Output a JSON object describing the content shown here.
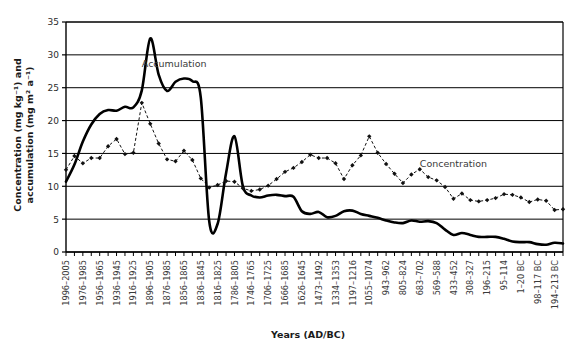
{
  "chart_data": {
    "type": "line",
    "title": "",
    "xlabel": "Years (AD/BC)",
    "ylabel": "Concentration (mg kg⁻¹) and accumulation (mg m² a⁻¹)",
    "ylabel_line1": "Concentration (mg kg⁻¹) and",
    "ylabel_line2": "accumulation (mg m² a⁻¹)",
    "ylim": [
      0,
      35
    ],
    "yticks": [
      0,
      5,
      10,
      15,
      20,
      25,
      30,
      35
    ],
    "grid": "horizontal",
    "legend_position": "inline-annotations",
    "annotations": [
      {
        "text": "Accumulation",
        "x_index": 9,
        "y": 28.2
      },
      {
        "text": "Concentration",
        "x_index": 42,
        "y": 13.0
      }
    ],
    "xtick_labels": [
      "1996–2005",
      "1976–1985",
      "1956–1965",
      "1936–1945",
      "1916–1925",
      "1896–1905",
      "1876–1985",
      "1856–1865",
      "1836–1845",
      "1816–1825",
      "1786–1805",
      "1746–1765",
      "1706–1725",
      "1666–1685",
      "1626–1645",
      "1473–1492",
      "1334–1353",
      "1197–1216",
      "1055–1074",
      "943–962",
      "805–824",
      "683–702",
      "569–588",
      "433–452",
      "308–327",
      "196–215",
      "95–114",
      "1–20 BC",
      "98–117 BC",
      "194–213 BC"
    ],
    "xtick_label_stride": 2,
    "n_points": 60,
    "series": [
      {
        "name": "Accumulation",
        "style": "solid-thick",
        "color": "#000000",
        "marker": "none",
        "values": [
          10.7,
          13.3,
          16.8,
          19.4,
          21.0,
          21.6,
          21.5,
          22.1,
          22.0,
          24.6,
          32.5,
          27.0,
          24.5,
          25.9,
          26.4,
          26.0,
          23.5,
          4.7,
          4.3,
          12.0,
          17.6,
          10.0,
          8.6,
          8.3,
          8.6,
          8.7,
          8.5,
          8.4,
          6.2,
          5.8,
          6.1,
          5.3,
          5.5,
          6.2,
          6.3,
          5.8,
          5.5,
          5.2,
          4.8,
          4.5,
          4.4,
          4.8,
          4.6,
          4.7,
          4.4,
          3.4,
          2.6,
          2.9,
          2.6,
          2.3,
          2.3,
          2.3,
          2.0,
          1.6,
          1.5,
          1.5,
          1.2,
          1.1,
          1.4,
          1.3
        ]
      },
      {
        "name": "Concentration",
        "style": "dashed-thin",
        "color": "#111111",
        "marker": "diamond",
        "values": [
          12.5,
          14.6,
          13.5,
          14.3,
          14.3,
          16.1,
          17.2,
          14.9,
          15.1,
          22.7,
          19.5,
          16.5,
          14.1,
          13.8,
          15.4,
          14.0,
          11.2,
          9.8,
          10.2,
          10.8,
          10.7,
          9.7,
          9.3,
          9.5,
          10.1,
          11.1,
          12.2,
          12.8,
          13.7,
          14.8,
          14.3,
          14.3,
          13.5,
          11.1,
          13.2,
          14.7,
          17.6,
          15.1,
          13.4,
          11.9,
          10.5,
          11.8,
          12.6,
          11.4,
          10.9,
          9.9,
          8.1,
          8.9,
          7.9,
          7.7,
          7.9,
          8.2,
          8.8,
          8.7,
          8.3,
          7.6,
          8.0,
          7.8,
          6.4,
          6.5
        ]
      }
    ]
  }
}
